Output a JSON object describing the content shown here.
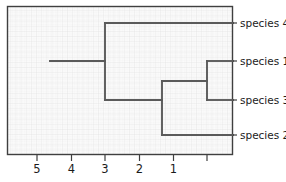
{
  "figure": {
    "kind": "dendrogram",
    "background": "#ffffff",
    "plot_background": "#fbfbfb",
    "grid_color": "#e4e4e4",
    "grid_minor_color": "#f0f0f0",
    "border_color": "#3f3f3f",
    "branch_color": "#5a5a5a",
    "text_color": "#1b1b1b"
  },
  "plot_area": {
    "left": 7,
    "top": 6,
    "right": 233,
    "bottom": 155
  },
  "axis": {
    "orientation": "bottom",
    "direction": "reversed",
    "tick_labels": [
      "5",
      "4",
      "3",
      "2",
      "1",
      ""
    ],
    "tick_x": [
      37,
      71.5,
      105,
      139.5,
      173.5,
      207
    ],
    "tick_values": [
      5,
      4,
      3,
      2,
      1,
      0
    ],
    "label": ""
  },
  "leaves": [
    {
      "name": "species 4",
      "y": 23,
      "branch_x_start": 105,
      "branch_x_end": 233
    },
    {
      "name": "species 1",
      "y": 61,
      "branch_x_start": 207,
      "branch_x_end": 233
    },
    {
      "name": "species 3",
      "y": 100,
      "branch_x_start": 207,
      "branch_x_end": 233
    },
    {
      "name": "species 2",
      "y": 135,
      "branch_x_start": 162,
      "branch_x_end": 233
    }
  ],
  "nodes": [
    {
      "id": "root-stub",
      "y": 61,
      "x_start": 50,
      "x_end": 105
    },
    {
      "id": "node-a",
      "x": 105,
      "y_top": 23,
      "y_bottom": 100,
      "merge_axis_value": 3
    },
    {
      "id": "node-a-lower-arm",
      "y": 100,
      "x_start": 105,
      "x_end": 162
    },
    {
      "id": "node-b",
      "x": 162,
      "y_top": 81,
      "y_bottom": 135,
      "merge_axis_value": 2
    },
    {
      "id": "node-b-upper-arm",
      "y": 81,
      "x_start": 162,
      "x_end": 207
    },
    {
      "id": "node-c",
      "x": 207,
      "y_top": 61,
      "y_bottom": 100,
      "merge_axis_value": 1
    }
  ],
  "chart_data": {
    "type": "line",
    "title": "",
    "xlabel": "",
    "ylabel": "",
    "xlim": [
      5.9,
      -0.1
    ],
    "grid": true,
    "legend": null,
    "categories": [
      "species 4",
      "species 1",
      "species 3",
      "species 2"
    ],
    "tick_labels": [
      "5",
      "4",
      "3",
      "2",
      "1"
    ],
    "merges": [
      {
        "join": [
          "species 1",
          "species 3"
        ],
        "distance": 1.0
      },
      {
        "join": [
          "species 1 + species 3",
          "species 2"
        ],
        "distance": 2.0
      },
      {
        "join": [
          "species 1 + species 3 + species 2",
          "species 4"
        ],
        "distance": 3.0
      }
    ]
  }
}
